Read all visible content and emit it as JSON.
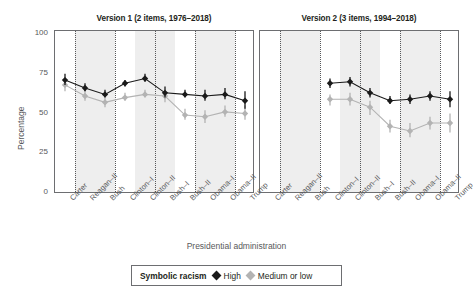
{
  "figure": {
    "ylabel": "Percentage",
    "xlabel": "Presidential administration",
    "y_ticks": [
      "100",
      "75",
      "50",
      "25",
      "0"
    ]
  },
  "panels": [
    {
      "title": "Version 1 (2 items, 1976–2018)"
    },
    {
      "title": "Version 2 (3 items, 1994–2018)"
    }
  ],
  "legend": {
    "title": "Symbolic racism",
    "entries": [
      {
        "label": "High",
        "marker": "diamond-icon",
        "color": "#1a1a1a"
      },
      {
        "label": "Medium or low",
        "marker": "diamond-icon",
        "color": "#b3b3b3"
      }
    ]
  },
  "x_categories": [
    "Carter",
    "Reagan–II",
    "Bush",
    "Clinton–I",
    "Clinton–II",
    "Bush–I",
    "Bush–II",
    "Obama–I",
    "Obama–II",
    "Trump"
  ],
  "chart_data": {
    "type": "line",
    "xlabel": "Presidential administration",
    "ylabel": "Percentage",
    "ylim": [
      0,
      100
    ],
    "yticks": [
      0,
      25,
      50,
      75,
      100
    ],
    "grid": false,
    "legend_position": "bottom",
    "categories": [
      "Carter",
      "Reagan–II",
      "Bush",
      "Clinton–I",
      "Clinton–II",
      "Bush–I",
      "Bush–II",
      "Obama–I",
      "Obama–II",
      "Trump"
    ],
    "panels": [
      {
        "title": "Version 1 (2 items, 1976–2018)",
        "series": [
          {
            "name": "High",
            "color": "#1a1a1a",
            "values": [
              71,
              66,
              62,
              69,
              72,
              63,
              62,
              61,
              62,
              58
            ],
            "err_low": [
              68,
              64,
              60,
              67,
              70,
              60,
              60,
              58,
              59,
              53
            ],
            "err_high": [
              75,
              69,
              65,
              71,
              75,
              67,
              65,
              65,
              66,
              64
            ]
          },
          {
            "name": "Medium or low",
            "color": "#b3b3b3",
            "values": [
              68,
              61,
              57,
              60,
              62,
              61,
              49,
              48,
              51,
              50
            ],
            "err_low": [
              64,
              58,
              54,
              58,
              60,
              57,
              46,
              44,
              48,
              46
            ],
            "err_high": [
              71,
              65,
              60,
              63,
              65,
              65,
              53,
              52,
              55,
              55
            ]
          }
        ]
      },
      {
        "title": "Version 2 (3 items, 1994–2018)",
        "series": [
          {
            "name": "High",
            "color": "#1a1a1a",
            "values": [
              null,
              null,
              null,
              69,
              70,
              63,
              58,
              59,
              61,
              59
            ],
            "err_low": [
              null,
              null,
              null,
              66,
              67,
              60,
              56,
              56,
              58,
              54
            ],
            "err_high": [
              null,
              null,
              null,
              72,
              73,
              66,
              61,
              62,
              64,
              64
            ]
          },
          {
            "name": "Medium or low",
            "color": "#b3b3b3",
            "values": [
              null,
              null,
              null,
              59,
              59,
              54,
              42,
              39,
              44,
              44
            ],
            "err_low": [
              null,
              null,
              null,
              55,
              55,
              49,
              38,
              35,
              40,
              38
            ],
            "err_high": [
              null,
              null,
              null,
              62,
              63,
              58,
              46,
              44,
              48,
              50
            ]
          }
        ]
      }
    ]
  }
}
